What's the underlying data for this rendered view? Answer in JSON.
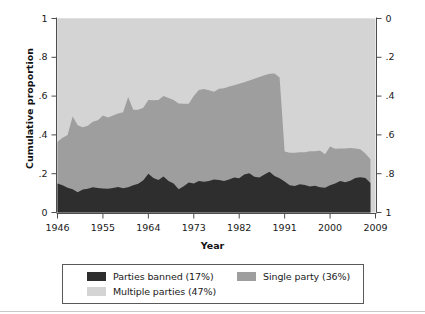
{
  "chart_data": {
    "type": "area",
    "title": "",
    "xlabel": "Year",
    "ylabel": "Cumulative proportion",
    "xlim": [
      1946,
      2009
    ],
    "ylim": [
      0,
      1
    ],
    "grid": false,
    "stacked": true,
    "x_ticks": [
      "1946",
      "1955",
      "1964",
      "1973",
      "1982",
      "1991",
      "2000",
      "2009"
    ],
    "x_tick_values": [
      1946,
      1955,
      1964,
      1973,
      1982,
      1991,
      2000,
      2009
    ],
    "y_ticks_left": [
      "0",
      ".2",
      ".4",
      ".6",
      ".8",
      "1"
    ],
    "y_tick_values_left": [
      0,
      0.2,
      0.4,
      0.6,
      0.8,
      1
    ],
    "y_ticks_right": [
      "0",
      ".2",
      ".4",
      ".6",
      ".8",
      "1"
    ],
    "y_tick_values_right": [
      0,
      0.2,
      0.4,
      0.6,
      0.8,
      1
    ],
    "right_axis_reversed": true,
    "legend_position": "below",
    "colors": {
      "parties_banned": "#2e2e2e",
      "single_party": "#9e9e9e",
      "multiple_parties": "#d4d4d4",
      "plot_background": "#d4d4d4",
      "axis": "#4d4d4d",
      "text": "#1a1a1a"
    },
    "x": [
      1946,
      1947,
      1948,
      1949,
      1950,
      1951,
      1952,
      1953,
      1954,
      1955,
      1956,
      1957,
      1958,
      1959,
      1960,
      1961,
      1962,
      1963,
      1964,
      1965,
      1966,
      1967,
      1968,
      1969,
      1970,
      1971,
      1972,
      1973,
      1974,
      1975,
      1976,
      1977,
      1978,
      1979,
      1980,
      1981,
      1982,
      1983,
      1984,
      1985,
      1986,
      1987,
      1988,
      1989,
      1990,
      1991,
      1992,
      1993,
      1994,
      1995,
      1996,
      1997,
      1998,
      1999,
      2000,
      2001,
      2002,
      2003,
      2004,
      2005,
      2006,
      2007,
      2008
    ],
    "series": [
      {
        "name": "Parties banned (17%)",
        "color": "#2e2e2e",
        "values": [
          0.15,
          0.14,
          0.128,
          0.12,
          0.105,
          0.118,
          0.122,
          0.13,
          0.126,
          0.124,
          0.122,
          0.126,
          0.132,
          0.125,
          0.13,
          0.14,
          0.148,
          0.166,
          0.2,
          0.178,
          0.168,
          0.185,
          0.162,
          0.15,
          0.12,
          0.135,
          0.155,
          0.15,
          0.162,
          0.158,
          0.162,
          0.17,
          0.168,
          0.163,
          0.17,
          0.18,
          0.176,
          0.196,
          0.202,
          0.184,
          0.18,
          0.196,
          0.21,
          0.188,
          0.176,
          0.16,
          0.14,
          0.136,
          0.146,
          0.142,
          0.134,
          0.138,
          0.13,
          0.128,
          0.14,
          0.15,
          0.162,
          0.156,
          0.164,
          0.178,
          0.182,
          0.178,
          0.152
        ]
      },
      {
        "name": "Single party (36%)",
        "color": "#9e9e9e",
        "values": [
          0.215,
          0.245,
          0.272,
          0.375,
          0.345,
          0.322,
          0.325,
          0.338,
          0.35,
          0.376,
          0.368,
          0.374,
          0.378,
          0.392,
          0.465,
          0.39,
          0.382,
          0.374,
          0.38,
          0.4,
          0.412,
          0.415,
          0.428,
          0.43,
          0.442,
          0.425,
          0.405,
          0.45,
          0.47,
          0.478,
          0.468,
          0.452,
          0.47,
          0.477,
          0.48,
          0.476,
          0.488,
          0.476,
          0.478,
          0.506,
          0.518,
          0.512,
          0.505,
          0.528,
          0.52,
          0.155,
          0.168,
          0.172,
          0.164,
          0.168,
          0.182,
          0.178,
          0.19,
          0.172,
          0.2,
          0.178,
          0.168,
          0.174,
          0.168,
          0.152,
          0.144,
          0.126,
          0.122
        ]
      },
      {
        "name": "Multiple parties (47%)",
        "color": "#d4d4d4",
        "values": [
          0.635,
          0.615,
          0.6,
          0.505,
          0.55,
          0.56,
          0.553,
          0.532,
          0.524,
          0.5,
          0.51,
          0.5,
          0.49,
          0.483,
          0.405,
          0.47,
          0.47,
          0.46,
          0.42,
          0.422,
          0.42,
          0.4,
          0.41,
          0.42,
          0.438,
          0.44,
          0.44,
          0.4,
          0.368,
          0.364,
          0.37,
          0.378,
          0.362,
          0.36,
          0.35,
          0.344,
          0.336,
          0.328,
          0.32,
          0.31,
          0.302,
          0.292,
          0.285,
          0.284,
          0.304,
          0.685,
          0.692,
          0.692,
          0.69,
          0.69,
          0.684,
          0.684,
          0.68,
          0.7,
          0.66,
          0.672,
          0.67,
          0.67,
          0.668,
          0.67,
          0.674,
          0.696,
          0.726
        ]
      }
    ]
  },
  "legend": {
    "items": [
      {
        "label": "Parties banned (17%)",
        "color": "#2e2e2e"
      },
      {
        "label": "Single party (36%)",
        "color": "#9e9e9e"
      },
      {
        "label": "Multiple parties (47%)",
        "color": "#d4d4d4"
      }
    ]
  },
  "axes": {
    "y_label": "Cumulative proportion",
    "x_label": "Year"
  }
}
